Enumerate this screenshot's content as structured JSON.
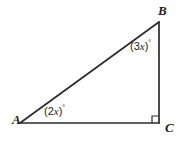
{
  "figure": {
    "type": "geometry-diagram",
    "shape": "right-triangle",
    "background_color": "#ffffff",
    "stroke_color": "#2b2b2b",
    "stroke_width": 1.7,
    "text_color": "#1d1d1d",
    "width": 187,
    "height": 143,
    "vertices": [
      {
        "name": "A",
        "label": "A",
        "x": 20,
        "y": 123
      },
      {
        "name": "B",
        "label": "B",
        "x": 159,
        "y": 22
      },
      {
        "name": "C",
        "label": "C",
        "x": 159,
        "y": 123
      }
    ],
    "sides": [
      {
        "name": "AB",
        "from": "A",
        "to": "B",
        "role": "hypotenuse"
      },
      {
        "name": "BC",
        "from": "B",
        "to": "C",
        "role": "vertical-leg"
      },
      {
        "name": "AC",
        "from": "A",
        "to": "C",
        "role": "horizontal-leg"
      }
    ],
    "angles": [
      {
        "at_vertex": "A",
        "expression": "(2x)",
        "open_paren": "(",
        "coefficient": "2",
        "variable": "x",
        "close_paren": ")",
        "degree_symbol": "°",
        "full_label": "(2x)°"
      },
      {
        "at_vertex": "B",
        "expression": "(3x)",
        "open_paren": "(",
        "coefficient": "3",
        "variable": "x",
        "close_paren": ")",
        "degree_symbol": "°",
        "full_label": "(3x)°"
      },
      {
        "at_vertex": "C",
        "expression": "90",
        "marker": "right-angle-square",
        "full_label": "90°"
      }
    ]
  }
}
